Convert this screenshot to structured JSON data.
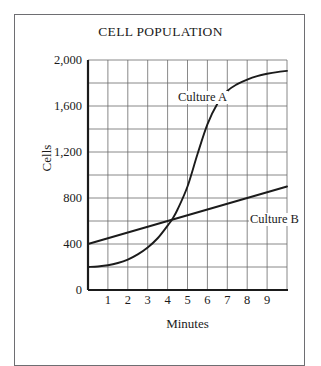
{
  "chart_data": {
    "type": "line",
    "title": "CELL POPULATION",
    "xlabel": "Minutes",
    "ylabel": "Cells",
    "xlim": [
      0,
      10
    ],
    "ylim": [
      0,
      2000
    ],
    "grid": true,
    "legend_position": "inline-annotation",
    "x_ticks": [
      "1",
      "2",
      "3",
      "4",
      "5",
      "6",
      "7",
      "8",
      "9"
    ],
    "x_tick_values": [
      1,
      2,
      3,
      4,
      5,
      6,
      7,
      8,
      9
    ],
    "y_ticks": [
      "0",
      "400",
      "800",
      "1,200",
      "1,600",
      "2,000"
    ],
    "y_tick_values": [
      0,
      400,
      800,
      1200,
      1600,
      2000
    ],
    "y_minor_step": 200,
    "x_minor_step": 1,
    "series": [
      {
        "name": "Culture A",
        "shape": "sigmoid",
        "color": "#1b1b1b",
        "x": [
          0,
          0.5,
          1,
          1.5,
          2,
          2.5,
          3,
          3.5,
          4,
          4.25,
          4.5,
          5,
          5.5,
          6,
          6.5,
          7,
          7.5,
          8,
          8.5,
          9,
          9.5,
          10
        ],
        "values": [
          200,
          205,
          215,
          235,
          265,
          310,
          370,
          450,
          560,
          620,
          700,
          900,
          1180,
          1440,
          1620,
          1730,
          1790,
          1830,
          1860,
          1880,
          1895,
          1905
        ]
      },
      {
        "name": "Culture B",
        "shape": "linear",
        "color": "#1b1b1b",
        "x": [
          0,
          10
        ],
        "values": [
          400,
          900
        ]
      }
    ],
    "annotations": [
      {
        "text": "Culture A",
        "x": 4.5,
        "y": 1720
      },
      {
        "text": "Culture B",
        "x": 8.1,
        "y": 660
      }
    ],
    "intersection": {
      "x": 4.2,
      "y": 600
    }
  },
  "figure": {
    "title": "CELL POPULATION",
    "axis": {
      "y_title": "Cells",
      "x_title": "Minutes"
    }
  }
}
